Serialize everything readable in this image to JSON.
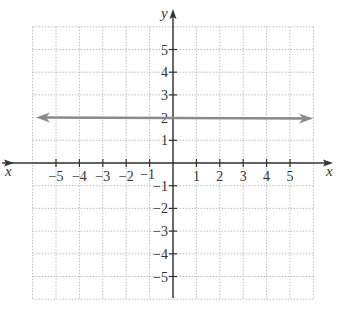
{
  "chart_data": {
    "type": "line",
    "title": "",
    "xlabel": "x",
    "ylabel": "y",
    "xlim": [
      -6,
      6
    ],
    "ylim": [
      -6,
      6
    ],
    "grid": true,
    "x_ticks": [
      -5,
      -4,
      -3,
      -2,
      -1,
      1,
      2,
      3,
      4,
      5
    ],
    "y_ticks": [
      -5,
      -4,
      -3,
      -2,
      -1,
      1,
      2,
      3,
      4,
      5
    ],
    "x_tick_labels": [
      "−5",
      "−4",
      "−3",
      "−2",
      "−1",
      "1",
      "2",
      "3",
      "4",
      "5"
    ],
    "y_tick_labels": [
      "−5",
      "−4",
      "−3",
      "−2",
      "−1",
      "1",
      "2",
      "3",
      "4",
      "5"
    ],
    "series": [
      {
        "name": "y = 2",
        "x": [
          -6,
          6
        ],
        "y": [
          2,
          2
        ],
        "color": "#8a8a8a",
        "arrows": "both"
      }
    ]
  },
  "labels": {
    "x_axis_left": "x",
    "x_axis_right": "x",
    "y_axis_top": "y"
  }
}
